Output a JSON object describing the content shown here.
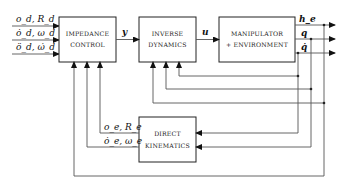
{
  "diagram": {
    "type": "block-diagram",
    "blocks": {
      "impedance": {
        "line1": "IMPEDANCE",
        "line2": "CONTROL"
      },
      "inverse": {
        "line1": "INVERSE",
        "line2": "DYNAMICS"
      },
      "manipulator": {
        "line1": "MANIPULATOR",
        "line2": "+ ENVIRONMENT"
      },
      "kinematics": {
        "line1": "DIRECT",
        "line2": "KINEMATICS"
      }
    },
    "inputs": {
      "in1": "o_d, R_d",
      "in2": "ȯ_d, ω_d",
      "in3": "ö_d, ω̇_d"
    },
    "signals": {
      "y": "y",
      "u": "u",
      "he": "h_e",
      "q": "q",
      "qdot": "q̇",
      "pose_e": "o_e, R_e",
      "vel_e": "ȯ_e, ω_e"
    },
    "colors": {
      "line": "#555555",
      "block": "#222222",
      "background": "#ffffff"
    }
  }
}
